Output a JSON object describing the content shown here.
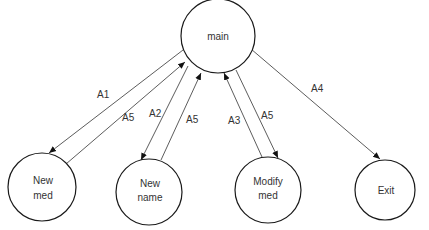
{
  "diagram": {
    "type": "state-transition",
    "nodes": [
      {
        "id": "main",
        "lines": [
          "main"
        ]
      },
      {
        "id": "new-med",
        "lines": [
          "New",
          "med"
        ]
      },
      {
        "id": "new-name",
        "lines": [
          "New",
          "name"
        ]
      },
      {
        "id": "modify-med",
        "lines": [
          "Modify",
          "med"
        ]
      },
      {
        "id": "exit",
        "lines": [
          "Exit"
        ]
      }
    ],
    "edges": [
      {
        "from": "main",
        "to": "new-med",
        "label": "A1"
      },
      {
        "from": "new-med",
        "to": "main",
        "label": "A5"
      },
      {
        "from": "main",
        "to": "new-name",
        "label": "A2"
      },
      {
        "from": "new-name",
        "to": "main",
        "label": "A5"
      },
      {
        "from": "modify-med",
        "to": "main",
        "label": "A3"
      },
      {
        "from": "main",
        "to": "modify-med",
        "label": "A5"
      },
      {
        "from": "main",
        "to": "exit",
        "label": "A4"
      }
    ],
    "colors": {
      "stroke": "#1a1a1a",
      "edge": "#4a4a4a",
      "text": "#333333",
      "background": "#ffffff"
    }
  }
}
